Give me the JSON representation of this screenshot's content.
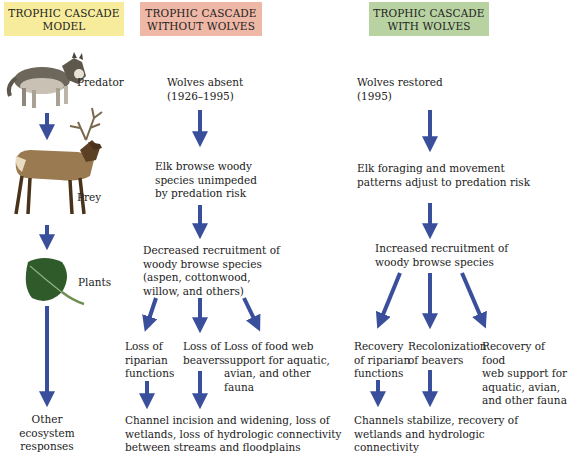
{
  "colors": {
    "arrow": "#3a4f9c",
    "model_header_bg": "#f7ec9c",
    "without_header_bg": "#efb7a5",
    "with_header_bg": "#b8d2a2"
  },
  "headers": {
    "model": "TROPHIC CASCADE\nMODEL",
    "without": "TROPHIC CASCADE\nWITHOUT WOLVES",
    "with": "TROPHIC CASCADE\nWITH WOLVES"
  },
  "model": {
    "predator": {
      "icon": "wolf-icon",
      "label": "Predator"
    },
    "prey": {
      "icon": "elk-icon",
      "label": "Prey"
    },
    "plants": {
      "icon": "aspen-leaf-icon",
      "label": "Plants"
    },
    "other": "Other\necosystem\nresponses"
  },
  "without": {
    "step1": "Wolves absent\n(1926–1995)",
    "step2": "Elk browse woody\nspecies unimpeded\nby predation risk",
    "step3": "Decreased recruitment of\nwoody browse species\n(aspen, cottonwood,\nwillow, and others)",
    "branch1": "Loss of\nriparian\nfunctions",
    "branch2": "Loss of\nbeavers",
    "branch3": "Loss of food web\nsupport for aquatic,\navian, and other\nfauna",
    "outcome": "Channel incision and widening, loss of\nwetlands, loss of hydrologic connectivity\nbetween streams and floodplains"
  },
  "with": {
    "step1": "Wolves restored\n(1995)",
    "step2": "Elk foraging and movement\npatterns adjust to predation risk",
    "step3": "Increased recruitment of\nwoody browse species",
    "branch1": "Recovery\nof riparian\nfunctions",
    "branch2": "Recolonization\nof beavers",
    "branch3": "Recovery of food\nweb support for\naquatic, avian,\nand other fauna",
    "outcome": "Channels stabilize, recovery of\nwetlands and hydrologic\nconnectivity"
  }
}
